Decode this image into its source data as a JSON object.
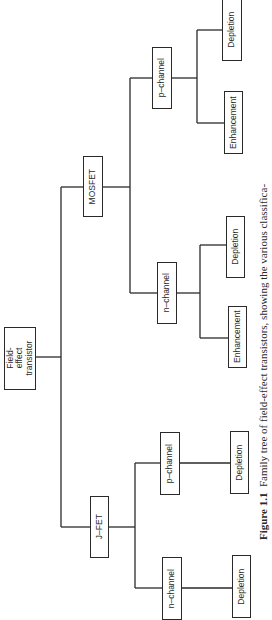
{
  "diagram": {
    "orientation": "rotated-90-ccw",
    "line_color": "#2a2a2a",
    "root": {
      "label": "Field-effect\ntransistor"
    },
    "branches": {
      "mosfet": {
        "label": "MOSFET",
        "p_channel": {
          "label": "p–channel",
          "children": [
            "Depletion",
            "Enhancement"
          ]
        },
        "n_channel": {
          "label": "n–channel",
          "children": [
            "Depletion",
            "Enhancement"
          ]
        }
      },
      "jfet": {
        "label": "J–FET",
        "p_channel": {
          "label": "p–channel",
          "children": [
            "Depletion"
          ]
        },
        "n_channel": {
          "label": "n–channel",
          "children": [
            "Depletion"
          ]
        }
      }
    }
  },
  "caption": {
    "figure_label": "Figure 1.1",
    "text": "Family tree of field-effect transistors, showing the various classifica-"
  }
}
